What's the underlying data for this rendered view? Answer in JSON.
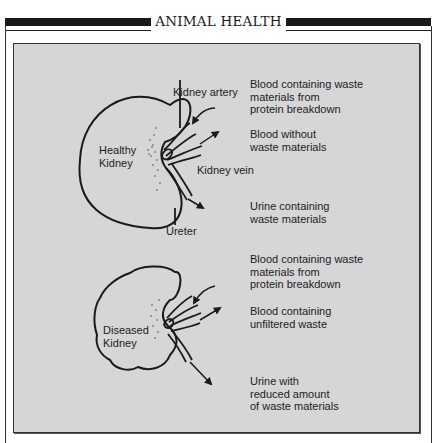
{
  "header": {
    "title": "ANIMAL HEALTH"
  },
  "healthy": {
    "kidney_label": "Healthy\nKidney",
    "labels": {
      "artery": "Kidney artery",
      "vein": "Kidney vein",
      "ureter": "Ureter"
    },
    "descriptions": {
      "blood_in": "Blood containing waste\nmaterials from\nprotein breakdown",
      "blood_out": "Blood without\nwaste materials",
      "urine": "Urine containing\nwaste materials"
    }
  },
  "diseased": {
    "kidney_label": "Diseased\nKidney",
    "descriptions": {
      "blood_in": "Blood containing waste\nmaterials from\nprotein breakdown",
      "blood_out": "Blood containing\nunfiltered waste",
      "urine": "Urine with\nreduced amount\nof waste materials"
    }
  },
  "colors": {
    "panel_bg": "#d6d6d6",
    "ink": "#1a1a1a"
  }
}
